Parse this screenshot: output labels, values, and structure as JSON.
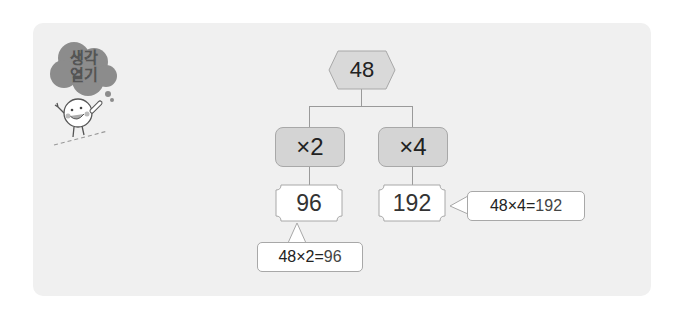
{
  "header": {
    "badge_line1": "생각",
    "badge_line2": "열기"
  },
  "diagram": {
    "root": "48",
    "operations": [
      {
        "label": "×2",
        "result": "96",
        "equation_left": "48×2=",
        "equation_result": "96"
      },
      {
        "label": "×4",
        "result": "192",
        "equation_left": "48×4=",
        "equation_result": "192"
      }
    ]
  },
  "colors": {
    "panel": "#f0f0f0",
    "root_fill": "#d9d9d9",
    "op_fill": "#d4d4d4",
    "result_fill": "#ffffff",
    "line": "#9a9a9a",
    "badge_cloud": "#8c8c8c"
  }
}
